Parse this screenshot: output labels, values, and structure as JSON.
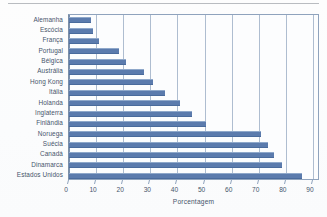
{
  "figure": {
    "background_color": "#ffffff",
    "bar_color": "#5b7bad",
    "grid_color": "#aebdd0",
    "axis_color": "#8fa3bd",
    "text_color": "#46556b"
  },
  "chart_data": {
    "type": "bar",
    "orientation": "horizontal",
    "title": "",
    "subtitle": "",
    "xlabel": "Porcentagem",
    "ylabel": "",
    "xlim": [
      0,
      90
    ],
    "xticks": [
      0,
      10,
      20,
      30,
      40,
      50,
      60,
      70,
      80,
      90
    ],
    "xticklabels": [
      "0",
      "10",
      "20",
      "30",
      "40",
      "50",
      "60",
      "70",
      "80",
      "90"
    ],
    "grid": true,
    "grid_axis": "x",
    "legend": false,
    "legend_position": "none",
    "annotations": [],
    "categories": [
      "Alemanha",
      "Escócia",
      "França",
      "Portugal",
      "Bélgica",
      "Austrália",
      "Hong Kong",
      "Itália",
      "Holanda",
      "Inglaterra",
      "Finlândia",
      "Noruega",
      "Suécia",
      "Canadá",
      "Dinamarca",
      "Estados Unidos"
    ],
    "values": [
      8,
      9,
      11,
      18.5,
      21,
      27.5,
      31,
      35.5,
      41,
      45.5,
      50.5,
      71,
      73.5,
      75.5,
      78.5,
      86
    ]
  }
}
